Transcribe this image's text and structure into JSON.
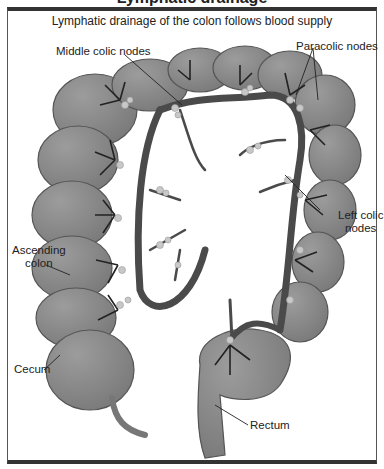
{
  "figure": {
    "cropped_title_fragment": "Lymphatic drainage",
    "subtitle": "Lymphatic drainage of the colon follows blood supply"
  },
  "labels": {
    "middle_colic_nodes": "Middle colic nodes",
    "paracolic_nodes": "Paracolic nodes",
    "left_colic_nodes_line1": "Left colic",
    "left_colic_nodes_line2": "nodes",
    "ascending_colon_line1": "Ascending",
    "ascending_colon_line2": "colon",
    "cecum": "Cecum",
    "rectum": "Rectum"
  },
  "colors": {
    "colon_fill": "#8a8a8a",
    "colon_stroke": "#555555",
    "vessel": "#4a4a4a",
    "node": "#c8c8c8",
    "frame": "#333333"
  }
}
